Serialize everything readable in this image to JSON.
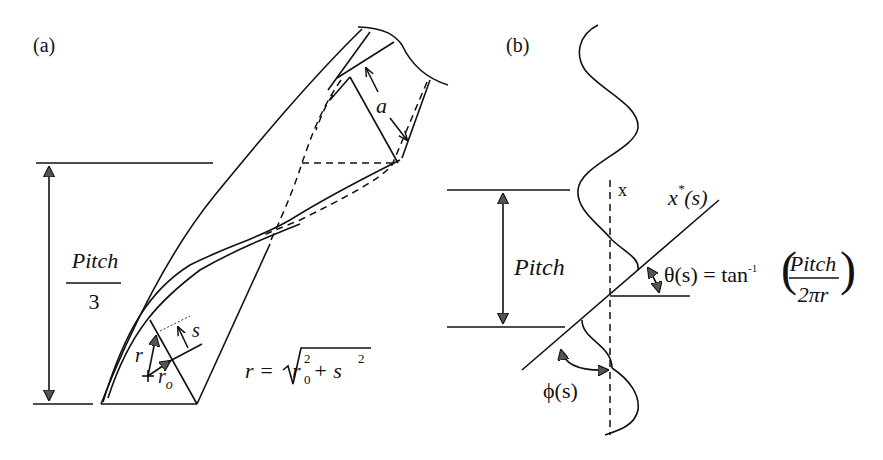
{
  "panel_a": {
    "label": "(a)",
    "pitch_fraction": {
      "numerator": "Pitch",
      "denominator": "3"
    },
    "a_label": "a",
    "s_label": "s",
    "r_label": "r",
    "r0_label": "r",
    "r0_sub": "o",
    "equation": {
      "lhs": "r = ",
      "r0": "r",
      "r0_sub": "0",
      "r0_sup": "2",
      "plus": " + s",
      "s_sup": "2"
    }
  },
  "panel_b": {
    "label": "(b)",
    "pitch_label": "Pitch",
    "x_label": "x",
    "xstar_label": "x",
    "xstar_sup": "*",
    "xstar_arg": "(s)",
    "theta_label": "θ(s) = tan",
    "theta_sup": "-1",
    "theta_frac": {
      "numerator": "Pitch",
      "denominator": "2πr"
    },
    "phi_label": "ϕ(s)"
  }
}
